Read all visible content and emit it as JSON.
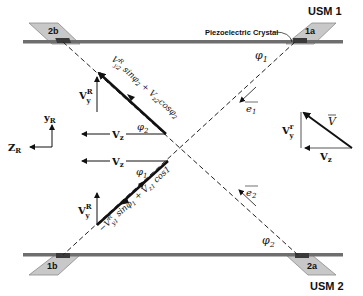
{
  "diagram": {
    "usm1_label": "USM 1",
    "usm2_label": "USM 2",
    "piezo_label": "Piezoelectric Crystal",
    "transducers": {
      "t1a": "1a",
      "t1b": "1b",
      "t2a": "2a",
      "t2b": "2b"
    },
    "angles": {
      "phi1_top": "φ1",
      "phi2_bottom": "φ2",
      "phi2_upper_vec": "φ2",
      "phi1_lower_vec": "φ1"
    },
    "unit_vectors": {
      "e1": "e1",
      "e2": "e2"
    },
    "upper_vector": {
      "vz_label": "Vz",
      "vy_label": "VyR",
      "expression": "V^R_y2 sinφ2 + V_z2 cosφ2"
    },
    "lower_vector": {
      "vz_label": "Vz",
      "vy_label": "VyR",
      "expression": "−V^R_y1 sinφ1 + V_z1 cos1"
    },
    "axes": {
      "y_label": "yR",
      "z_label": "ZR"
    },
    "velocity_triangle": {
      "v_label": "V",
      "vy_label": "Vyr",
      "vz_label": "Vz"
    },
    "colors": {
      "pipe_wall": "#6e6e6e",
      "transducer_fill": "#c8c8c8",
      "crystal": "#3a3a3a",
      "line": "#111111"
    }
  }
}
